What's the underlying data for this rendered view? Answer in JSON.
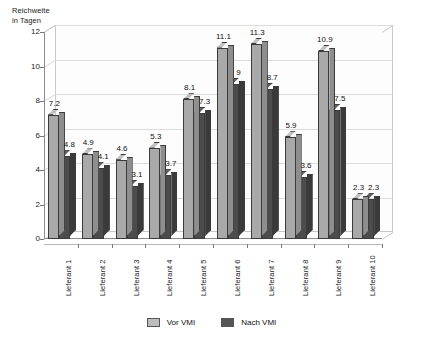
{
  "chart_data": {
    "type": "bar",
    "title": "",
    "subtitle": "",
    "xlabel": "",
    "ylabel": "Reichweite\nin Tagen",
    "ylabel_lines": [
      "Reichweite",
      "in Tagen"
    ],
    "categories": [
      "Lieferant 1",
      "Lieferant 2",
      "Lieferant 3",
      "Lieferant 4",
      "Lieferant 5",
      "Lieferant 6",
      "Lieferant 7",
      "Lieferant 8",
      "Lieferant 9",
      "Lieferant 10"
    ],
    "series": [
      {
        "name": "Vor VMI",
        "color": "#a9a9a9",
        "values": [
          7.2,
          4.9,
          4.6,
          5.3,
          8.1,
          11.1,
          11.3,
          5.9,
          10.9,
          2.3
        ],
        "labels": [
          "7.2",
          "4.9",
          "4.6",
          "5.3",
          "8.1",
          "11.1",
          "11.3",
          "5.9",
          "10.9",
          "2.3"
        ]
      },
      {
        "name": "Nach VMI",
        "color": "#4c4c4c",
        "values": [
          4.8,
          4.1,
          3.1,
          3.7,
          7.3,
          9.0,
          8.7,
          3.6,
          7.5,
          2.3
        ],
        "labels": [
          "4.8",
          "4.1",
          "3.1",
          "3.7",
          "7.3",
          "9",
          "8.7",
          "3.6",
          "7.5",
          "2.3"
        ]
      }
    ],
    "ylim": [
      0,
      12
    ],
    "yticks": [
      0,
      2,
      4,
      6,
      8,
      10,
      12
    ],
    "ytick_labels": [
      "0",
      "2",
      "4",
      "6",
      "8",
      "10",
      "12"
    ],
    "grid": true,
    "grid_axis": "y",
    "legend_position": "bottom",
    "style": "3d-clustered-column",
    "background_color": "#ffffff",
    "plot_border_color": "#c9c9c9",
    "gridline_color": "#d4d4d4",
    "axis_color": "#8c8c8c"
  },
  "legend": {
    "items": [
      {
        "label": "Vor VMI",
        "color": "#bdbdbd"
      },
      {
        "label": "Nach VMI",
        "color": "#555555"
      }
    ]
  }
}
